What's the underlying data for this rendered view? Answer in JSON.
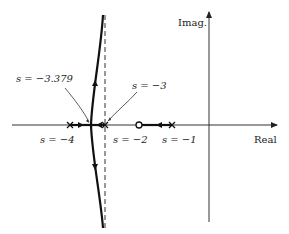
{
  "diagram": {
    "type": "root-locus",
    "axes": {
      "real_label": "Real",
      "imag_label": "Imag."
    },
    "poles": [
      {
        "label": "s = −4",
        "value": -4
      },
      {
        "label": "s = −3",
        "value": -3
      },
      {
        "label": "s = −1",
        "value": -1
      }
    ],
    "zeros": [
      {
        "label": "s = −2",
        "value": -2
      }
    ],
    "breakaway": {
      "label": "s = −3.379",
      "value": -3.379
    },
    "asymptote": {
      "value": -3,
      "style": "dashed"
    },
    "colors": {
      "ink": "#222222",
      "background": "#ffffff"
    }
  }
}
